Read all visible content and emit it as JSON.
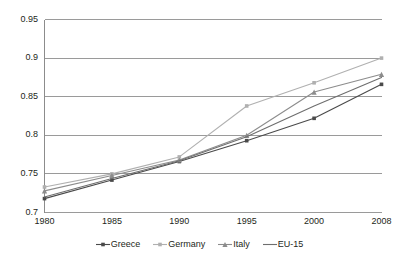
{
  "chart_data": {
    "type": "line",
    "title": "",
    "xlabel": "",
    "ylabel": "",
    "categories": [
      "1980",
      "1985",
      "1990",
      "1995",
      "2000",
      "2008"
    ],
    "x": [
      1980,
      1985,
      1990,
      1995,
      2000,
      2008
    ],
    "xlim": [
      1980,
      2008
    ],
    "ylim": [
      0.7,
      0.95
    ],
    "yticks": [
      "0.7",
      "0.75",
      "0.8",
      "0.85",
      "0.9",
      "0.95"
    ],
    "ytick_values": [
      0.7,
      0.75,
      0.8,
      0.85,
      0.9,
      0.95
    ],
    "grid": "horizontal",
    "legend_position": "bottom",
    "series": [
      {
        "name": "Greece",
        "color": "#4a4a4a",
        "marker": "square",
        "values": [
          0.718,
          0.742,
          0.766,
          0.793,
          0.822,
          0.866
        ]
      },
      {
        "name": "Germany",
        "color": "#b0b0b0",
        "marker": "square",
        "values": [
          0.733,
          0.75,
          0.772,
          0.838,
          0.868,
          0.9
        ]
      },
      {
        "name": "Italy",
        "color": "#8c8c8c",
        "marker": "triangle",
        "values": [
          0.728,
          0.748,
          0.768,
          0.8,
          0.856,
          0.879
        ]
      },
      {
        "name": "EU-15",
        "color": "#6e6e6e",
        "marker": "none",
        "values": [
          0.72,
          0.744,
          0.767,
          0.798,
          0.838,
          0.875
        ]
      }
    ]
  },
  "axis": {
    "frame_color": "#8c8c8c",
    "grid_color": "#9a9a9a",
    "tick_text_color": "#231f20"
  }
}
